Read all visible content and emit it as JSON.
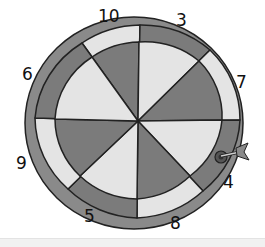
{
  "illustration": {
    "subject": "dartboard",
    "sector_count": 8,
    "colors": {
      "dark": "#7b7b7b",
      "light": "#e4e4e4",
      "outline": "#222222",
      "rim": "#8a8a8a",
      "background": "#ffffff"
    },
    "numbers": [
      {
        "label": "10",
        "position": "top-left"
      },
      {
        "label": "3",
        "position": "top-right"
      },
      {
        "label": "7",
        "position": "right-upper"
      },
      {
        "label": "4",
        "position": "right-lower"
      },
      {
        "label": "8",
        "position": "bottom-right"
      },
      {
        "label": "5",
        "position": "bottom-left"
      },
      {
        "label": "9",
        "position": "left-lower"
      },
      {
        "label": "6",
        "position": "left-upper"
      }
    ],
    "dart": {
      "present": true,
      "stuck_near": "4"
    }
  }
}
